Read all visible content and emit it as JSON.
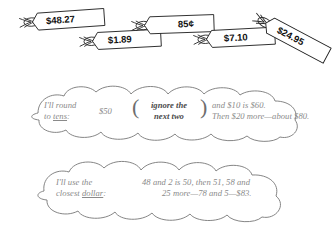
{
  "page": {
    "background_color": "#ffffff",
    "text_color": "#8a8a8a",
    "tag_text_color": "#111111",
    "outline_color": "#777777"
  },
  "price_tags": [
    {
      "name": "tag-48-27",
      "value": "$48.27",
      "x": 18,
      "y": 13,
      "width": 62,
      "height": 17,
      "rotation": -4
    },
    {
      "name": "tag-1-89",
      "value": "$1.89",
      "x": 78,
      "y": 32,
      "width": 58,
      "height": 17,
      "rotation": -3
    },
    {
      "name": "tag-85c",
      "value": "85¢",
      "x": 130,
      "y": 16,
      "width": 60,
      "height": 17,
      "rotation": -2
    },
    {
      "name": "tag-7-10",
      "value": "$7.10",
      "x": 192,
      "y": 30,
      "width": 60,
      "height": 17,
      "rotation": -3
    },
    {
      "name": "tag-24-95",
      "value": "$24.95",
      "x": 252,
      "y": 14,
      "width": 62,
      "height": 17,
      "rotation": 28
    }
  ],
  "bubbles": [
    {
      "name": "round-to-tens-bubble",
      "label": {
        "line1": "I'll round",
        "line2_prefix": "to ",
        "line2_underline": "tens",
        "line2_suffix": ":"
      },
      "amount": "$50",
      "paren_note": {
        "line1": "ignore the",
        "line2": "next two"
      },
      "paren_open": "(",
      "paren_close": ")",
      "body": {
        "line1": "and $10 is $60.",
        "line2": "Then $20 more—about $80."
      }
    },
    {
      "name": "closest-dollar-bubble",
      "label": {
        "line1": "I'll use the",
        "line2_prefix": "closest ",
        "line2_underline": "dollar",
        "line2_suffix": ":"
      },
      "body": {
        "line1": "48 and 2 is 50, then 51, 58 and",
        "line2": "25 more—78 and 5—$83."
      }
    }
  ]
}
